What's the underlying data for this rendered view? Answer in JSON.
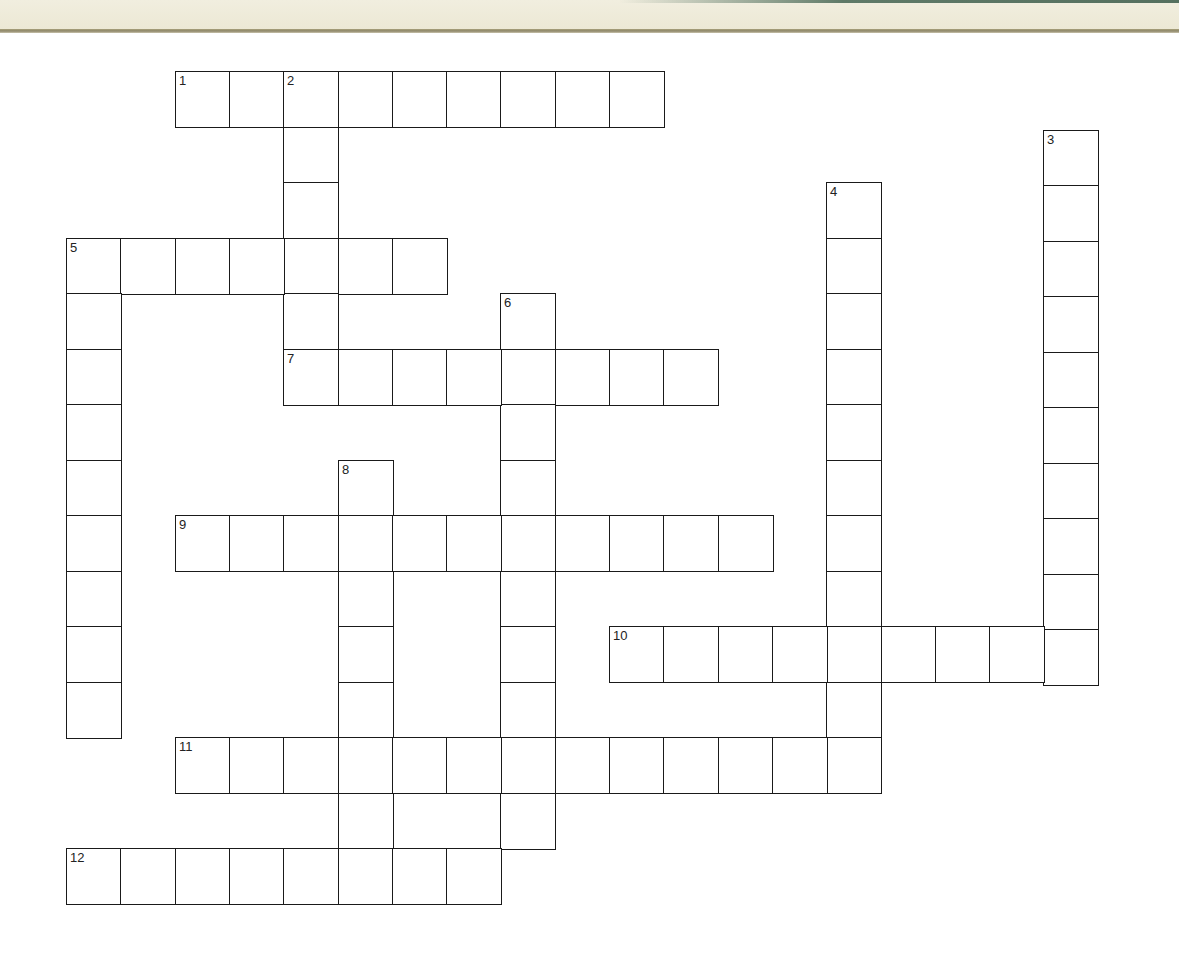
{
  "header": {
    "band_color": "#efecdb",
    "stripe_color": "#5f7a68",
    "rule_color": "#9a9272"
  },
  "grid_geometry": {
    "origin_x": 66,
    "origin_y": 71,
    "cell_w": 54.3,
    "cell_h": 55.5,
    "row_offsets": {
      "1": 3
    }
  },
  "entries": [
    {
      "number": "1",
      "direction": "across",
      "row": 0,
      "col": 2,
      "length": 9
    },
    {
      "number": "2",
      "direction": "down",
      "row": 0,
      "col": 4,
      "length": 6
    },
    {
      "number": "3",
      "direction": "down",
      "row": 1,
      "col": 18,
      "length": 10
    },
    {
      "number": "4",
      "direction": "down",
      "row": 2,
      "col": 14,
      "length": 11
    },
    {
      "number": "5",
      "direction": "across",
      "row": 3,
      "col": 0,
      "length": 7
    },
    {
      "number": "5",
      "direction": "down",
      "row": 3,
      "col": 0,
      "length": 9
    },
    {
      "number": "6",
      "direction": "down",
      "row": 4,
      "col": 8,
      "length": 10
    },
    {
      "number": "7",
      "direction": "across",
      "row": 5,
      "col": 4,
      "length": 8
    },
    {
      "number": "8",
      "direction": "down",
      "row": 7,
      "col": 5,
      "length": 8
    },
    {
      "number": "9",
      "direction": "across",
      "row": 8,
      "col": 2,
      "length": 11
    },
    {
      "number": "10",
      "direction": "across",
      "row": 10,
      "col": 10,
      "length": 9
    },
    {
      "number": "11",
      "direction": "across",
      "row": 12,
      "col": 2,
      "length": 13
    },
    {
      "number": "12",
      "direction": "across",
      "row": 14,
      "col": 0,
      "length": 8
    }
  ],
  "cell_values": {}
}
